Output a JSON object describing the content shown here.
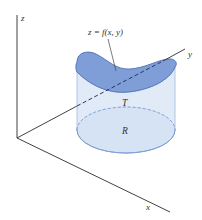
{
  "figure": {
    "axes": {
      "x_label": "x",
      "y_label": "y",
      "z_label": "z"
    },
    "surface_label": "z = f(x, y)",
    "solid_label": "T",
    "region_label": "R",
    "colors": {
      "surface_fill": "#7f9ed8",
      "surface_stroke": "#4f6fb3",
      "wall_fill": "#dce7f6",
      "wall_stroke": "#9fb7df",
      "base_fill": "#b3c8ec",
      "base_stroke": "#7e9ad2",
      "axis": "#2b2b2b",
      "label": "#333333"
    }
  }
}
